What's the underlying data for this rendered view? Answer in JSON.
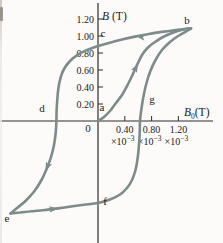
{
  "colors": {
    "curve": "#7d8b8b",
    "axis": "#2f2d2b",
    "ink": "#1c1a18",
    "background": "#fcfbfa"
  },
  "figure": {
    "origin_label": "0",
    "y_axis": {
      "label_main": "B",
      "label_unit": "(T)",
      "ticks": [
        {
          "label": "1.20",
          "value": 1.2
        },
        {
          "label": "1.00",
          "value": 1.0
        },
        {
          "label": "0.80",
          "value": 0.8
        },
        {
          "label": "0.60",
          "value": 0.6
        },
        {
          "label": "0.40",
          "value": 0.4
        },
        {
          "label": "0.20",
          "value": 0.2
        }
      ]
    },
    "x_axis": {
      "label_main": "B",
      "label_sub": "0",
      "label_unit": "(T)",
      "multiplier_base": "×10",
      "multiplier_exp": "−3",
      "ticks": [
        {
          "label": "0.40",
          "value": 0.4
        },
        {
          "label": "0.80",
          "value": 0.8
        },
        {
          "label": "1.20",
          "value": 1.2
        }
      ]
    }
  },
  "chart_data": {
    "type": "line",
    "xlabel": "B0 (T)",
    "ylabel": "B (T)",
    "x_unit_scale": "×10−3",
    "xlim": [
      -1.46,
      1.72
    ],
    "ylim": [
      -1.44,
      1.39
    ],
    "grid": false,
    "px_mapping": {
      "x0": 98,
      "y0": 121,
      "px_per_x": 67,
      "px_per_y": 85
    },
    "points": [
      {
        "label": "a",
        "x": 0,
        "y": 0
      },
      {
        "label": "b",
        "x": 1.388,
        "y": 1.092
      },
      {
        "label": "c",
        "x": 0,
        "y": 0.882
      },
      {
        "label": "d",
        "x": -0.621,
        "y": 0
      },
      {
        "label": "e",
        "x": -1.306,
        "y": -1.088
      },
      {
        "label": "f",
        "x": 0,
        "y": -0.965
      },
      {
        "label": "g",
        "x": 0.627,
        "y": 0
      }
    ],
    "series": [
      {
        "name": "initial_magnetization",
        "x": [
          0,
          0.09,
          0.179,
          0.269,
          0.358,
          0.433,
          0.507,
          0.582,
          0.657,
          0.746,
          0.851,
          0.97,
          1.104,
          1.254,
          1.388
        ],
        "y": [
          0,
          0.047,
          0.118,
          0.212,
          0.306,
          0.412,
          0.529,
          0.659,
          0.776,
          0.865,
          0.929,
          0.988,
          1.035,
          1.073,
          1.092
        ]
      },
      {
        "name": "descending_branch",
        "x": [
          1.388,
          1.194,
          0.985,
          0.776,
          0.567,
          0.358,
          0.164,
          0,
          -0.164,
          -0.299,
          -0.418,
          -0.507,
          -0.56,
          -0.593,
          -0.609,
          -0.618,
          -0.621,
          -0.63,
          -0.657,
          -0.701,
          -0.761,
          -0.843,
          -0.948,
          -1.082,
          -1.209,
          -1.306
        ],
        "y": [
          1.092,
          1.073,
          1.052,
          1.026,
          0.995,
          0.958,
          0.918,
          0.882,
          0.835,
          0.781,
          0.706,
          0.612,
          0.506,
          0.376,
          0.235,
          0.118,
          0,
          -0.129,
          -0.282,
          -0.424,
          -0.553,
          -0.694,
          -0.824,
          -0.941,
          -1.024,
          -1.088
        ]
      },
      {
        "name": "ascending_branch",
        "x": [
          -1.306,
          -1.164,
          -0.985,
          -0.791,
          -0.597,
          -0.403,
          -0.209,
          0,
          0.179,
          0.328,
          0.433,
          0.507,
          0.56,
          0.594,
          0.615,
          0.624,
          0.627,
          0.646,
          0.675,
          0.716,
          0.776,
          0.858,
          0.955,
          1.075,
          1.209,
          1.313,
          1.388
        ],
        "y": [
          -1.088,
          -1.076,
          -1.062,
          -1.047,
          -1.028,
          -1.006,
          -0.986,
          -0.965,
          -0.924,
          -0.865,
          -0.788,
          -0.694,
          -0.576,
          -0.424,
          -0.247,
          -0.106,
          0,
          0.129,
          0.271,
          0.424,
          0.576,
          0.718,
          0.835,
          0.929,
          1.006,
          1.053,
          1.087
        ]
      }
    ],
    "arrows": [
      {
        "x": 0.597,
        "y": 0.676,
        "angle": -63
      },
      {
        "x": 0.567,
        "y": 0.996,
        "angle": 188
      },
      {
        "x": -0.784,
        "y": -0.588,
        "angle": 113
      },
      {
        "x": -0.597,
        "y": -1.028,
        "angle": -7
      }
    ]
  }
}
